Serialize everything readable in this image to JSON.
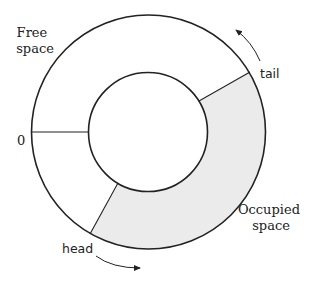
{
  "diagram": {
    "labels": {
      "free_space_line1": "Free",
      "free_space_line2": "space",
      "zero": "0",
      "tail": "tail",
      "head": "head",
      "occupied_line1": "Occupied",
      "occupied_line2": "space"
    },
    "colors": {
      "stroke": "#222222",
      "occupied_fill": "#ebebeb",
      "background": "#ffffff"
    }
  }
}
